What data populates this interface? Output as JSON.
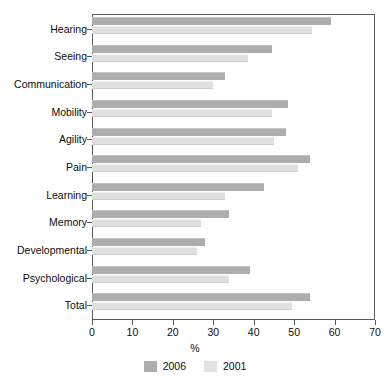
{
  "chart_data": {
    "type": "bar",
    "orientation": "horizontal",
    "title": "",
    "xlabel": "%",
    "ylabel": "",
    "xlim": [
      0,
      70
    ],
    "xticks": [
      0,
      10,
      20,
      30,
      40,
      50,
      60,
      70
    ],
    "grid": false,
    "legend_position": "bottom",
    "categories": [
      "Hearing",
      "Seeing",
      "Communication",
      "Mobility",
      "Agility",
      "Pain",
      "Learning",
      "Memory",
      "Developmental",
      "Psychological",
      "Total"
    ],
    "series": [
      {
        "name": "2006",
        "color": "#adadad",
        "values": [
          59.0,
          44.5,
          33.0,
          48.5,
          48.0,
          54.0,
          42.5,
          34.0,
          28.0,
          39.0,
          54.0
        ]
      },
      {
        "name": "2001",
        "color": "#e0e0e0",
        "values": [
          54.5,
          38.5,
          30.0,
          44.5,
          45.0,
          51.0,
          33.0,
          27.0,
          26.0,
          34.0,
          49.5
        ]
      }
    ]
  },
  "legend": {
    "items": [
      {
        "label": "2006"
      },
      {
        "label": "2001"
      }
    ]
  }
}
